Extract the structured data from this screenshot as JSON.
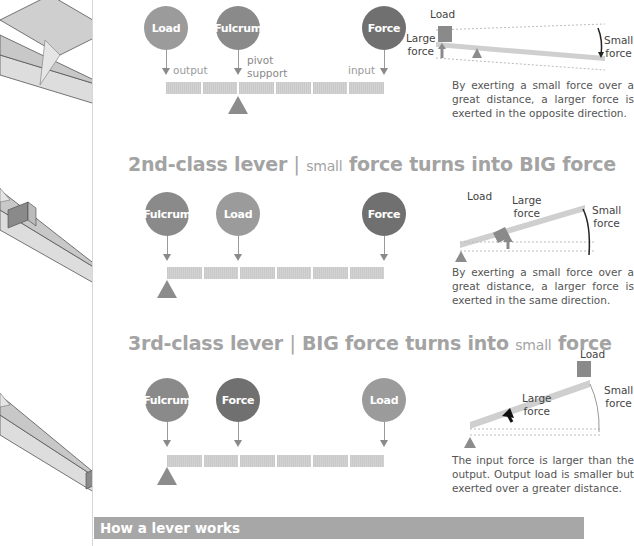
{
  "diagrams": [
    {
      "id": "first-class",
      "title": null,
      "nodes": [
        {
          "label": "Load",
          "role": "load"
        },
        {
          "label": "Fulcrum",
          "role": "fulcrum"
        },
        {
          "label": "Force",
          "role": "force"
        }
      ],
      "annotations": {
        "output": "output",
        "pivot_line1": "pivot",
        "pivot_line2": "support",
        "input": "input"
      },
      "mini": {
        "load": "Load",
        "large_force": "Large\nforce",
        "small_force": "Small\nforce"
      },
      "description": "By exerting a small force over a great distance, a larger force is exerted in the opposite direction."
    },
    {
      "id": "second-class",
      "title": {
        "main": "2nd-class lever",
        "sep": "|",
        "a": "small",
        "b": "force turns into",
        "c": "BIG",
        "d": "force"
      },
      "nodes": [
        {
          "label": "Fulcrum",
          "role": "fulcrum"
        },
        {
          "label": "Load",
          "role": "load"
        },
        {
          "label": "Force",
          "role": "force"
        }
      ],
      "mini": {
        "load": "Load",
        "large_force": "Large\nforce",
        "small_force": "Small\nforce"
      },
      "description": "By exerting a small force over a great distance, a larger force is exerted in the same direction."
    },
    {
      "id": "third-class",
      "title": {
        "main": "3rd-class lever",
        "sep": "|",
        "a": "BIG",
        "b": "force turns into",
        "c": "small",
        "d": "force"
      },
      "nodes": [
        {
          "label": "Fulcrum",
          "role": "fulcrum"
        },
        {
          "label": "Force",
          "role": "force"
        },
        {
          "label": "Load",
          "role": "load"
        }
      ],
      "mini": {
        "load": "Load",
        "large_force": "Large\nforce",
        "small_force": "Small\nforce"
      },
      "description": "The input force is larger than the output. Output load is smaller but exerted over a greater distance."
    }
  ],
  "section_header": "How a lever works"
}
